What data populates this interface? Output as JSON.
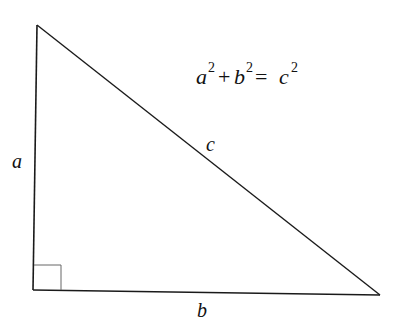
{
  "diagram": {
    "equation": {
      "a": "a",
      "a_exp": "2",
      "plus": "+",
      "b": "b",
      "b_exp": "2",
      "equals": "=",
      "c": "c",
      "c_exp": "2"
    },
    "labels": {
      "side_a": "a",
      "side_b": "b",
      "side_c": "c"
    },
    "vertices": {
      "top": [
        37,
        25
      ],
      "bottom_left": [
        33,
        290
      ],
      "bottom_right": [
        380,
        295
      ]
    },
    "colors": {
      "line": "#1a1a1a",
      "right_angle_marker": "#555555",
      "background": "#ffffff"
    }
  }
}
